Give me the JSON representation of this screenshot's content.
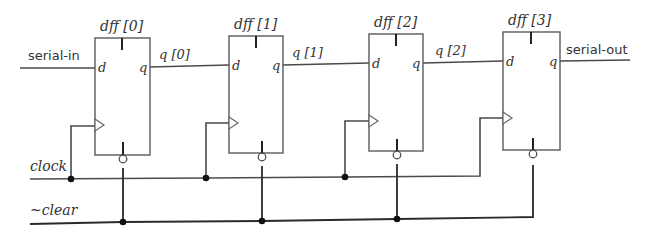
{
  "diagram": {
    "type": "4-bit shift register schematic",
    "signals": {
      "serial_in": "serial-in",
      "serial_out": "serial-out",
      "clock": "clock",
      "clear": "~clear"
    },
    "flipflops": [
      {
        "name": "dff [0]",
        "d": "d",
        "q": "q",
        "out_net": "q [0]"
      },
      {
        "name": "dff [1]",
        "d": "d",
        "q": "q",
        "out_net": "q [1]"
      },
      {
        "name": "dff [2]",
        "d": "d",
        "q": "q",
        "out_net": "q [2]"
      },
      {
        "name": "dff [3]",
        "d": "d",
        "q": "q",
        "out_net": "serial-out"
      }
    ],
    "nets": [
      "q [0]",
      "q [1]",
      "q [2]"
    ],
    "colors": {
      "wire": "#4a4a4a",
      "box": "#5a5a5a",
      "junction": "#111111",
      "text": "#333333",
      "background": "#ffffff"
    }
  }
}
